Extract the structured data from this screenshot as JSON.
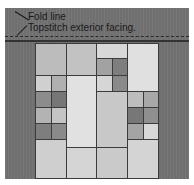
{
  "labels": {
    "fold_line": "Fold line",
    "topstitch": "Topstitch exterior facing."
  },
  "colors": {
    "strip": "#6f6f6f",
    "dark": "#7a7a7a",
    "mid": "#a5a5a5",
    "light": "#c4c4c4",
    "lighter": "#d6d6d6",
    "lightest": "#e2e2e2"
  },
  "cells": [
    {
      "x": 35,
      "y": 43,
      "w": 32,
      "h": 33,
      "c": "#bcbcbc"
    },
    {
      "x": 66,
      "y": 43,
      "w": 31,
      "h": 33,
      "c": "#c2c2c2"
    },
    {
      "x": 96,
      "y": 43,
      "w": 32,
      "h": 16,
      "c": "#d8d8d8"
    },
    {
      "x": 96,
      "y": 58,
      "w": 17,
      "h": 18,
      "c": "#a2a2a2"
    },
    {
      "x": 112,
      "y": 58,
      "w": 16,
      "h": 18,
      "c": "#7e7e7e"
    },
    {
      "x": 127,
      "y": 43,
      "w": 32,
      "h": 49,
      "c": "#e0e0e0"
    },
    {
      "x": 35,
      "y": 75,
      "w": 17,
      "h": 17,
      "c": "#d0d0d0"
    },
    {
      "x": 51,
      "y": 75,
      "w": 16,
      "h": 17,
      "c": "#b0b0b0"
    },
    {
      "x": 35,
      "y": 91,
      "w": 17,
      "h": 17,
      "c": "#8c8c8c"
    },
    {
      "x": 51,
      "y": 91,
      "w": 16,
      "h": 17,
      "c": "#767676"
    },
    {
      "x": 66,
      "y": 75,
      "w": 31,
      "h": 73,
      "c": "#e1e1e1"
    },
    {
      "x": 96,
      "y": 75,
      "w": 17,
      "h": 17,
      "c": "#d6d6d6"
    },
    {
      "x": 112,
      "y": 75,
      "w": 16,
      "h": 17,
      "c": "#8a8a8a"
    },
    {
      "x": 96,
      "y": 91,
      "w": 32,
      "h": 57,
      "c": "#c8c8c8"
    },
    {
      "x": 127,
      "y": 91,
      "w": 17,
      "h": 17,
      "c": "#bdbdbd"
    },
    {
      "x": 143,
      "y": 91,
      "w": 16,
      "h": 17,
      "c": "#a8a8a8"
    },
    {
      "x": 35,
      "y": 107,
      "w": 17,
      "h": 17,
      "c": "#b3b3b3"
    },
    {
      "x": 51,
      "y": 107,
      "w": 16,
      "h": 17,
      "c": "#c4c4c4"
    },
    {
      "x": 127,
      "y": 107,
      "w": 17,
      "h": 17,
      "c": "#777777"
    },
    {
      "x": 143,
      "y": 107,
      "w": 16,
      "h": 17,
      "c": "#8f8f8f"
    },
    {
      "x": 35,
      "y": 123,
      "w": 17,
      "h": 17,
      "c": "#7e7e7e"
    },
    {
      "x": 51,
      "y": 123,
      "w": 16,
      "h": 17,
      "c": "#8a8a8a"
    },
    {
      "x": 127,
      "y": 123,
      "w": 17,
      "h": 17,
      "c": "#a4a4a4"
    },
    {
      "x": 143,
      "y": 123,
      "w": 16,
      "h": 17,
      "c": "#d8d8d8"
    },
    {
      "x": 35,
      "y": 139,
      "w": 32,
      "h": 40,
      "c": "#cfcfcf"
    },
    {
      "x": 66,
      "y": 147,
      "w": 31,
      "h": 32,
      "c": "#d5d5d5"
    },
    {
      "x": 96,
      "y": 147,
      "w": 32,
      "h": 32,
      "c": "#cacaca"
    },
    {
      "x": 127,
      "y": 139,
      "w": 32,
      "h": 40,
      "c": "#d4d4d4"
    }
  ]
}
